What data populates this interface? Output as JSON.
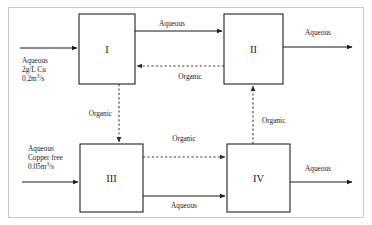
{
  "diagram": {
    "units": [
      {
        "id": "unit-1",
        "label": "I"
      },
      {
        "id": "unit-2",
        "label": "II"
      },
      {
        "id": "unit-3",
        "label": "III"
      },
      {
        "id": "unit-4",
        "label": "IV"
      }
    ],
    "feeds": {
      "left_top": {
        "line1": "Aqueous",
        "line2_prefix": "2g/L Cu",
        "line3_value": "0.2m",
        "line3_sup": "3",
        "line3_suffix": "/s"
      },
      "left_bottom": {
        "line1": "Aqueous",
        "line2": "Copper free",
        "line3_value": "0.05m",
        "line3_sup": "3",
        "line3_suffix": "/s"
      }
    },
    "streams": {
      "aqueous_1_to_2": "Aqueous",
      "aqueous_out_2": "Aqueous",
      "organic_2_to_1": "Organic",
      "organic_1_to_3": "Organic",
      "organic_3_to_4": "Organic",
      "organic_4_to_2": "Organic",
      "aqueous_3_to_4": "Aqueous",
      "aqueous_out_4": "Aqueous"
    },
    "colors": {
      "line": "#1a1a1a",
      "dashed": "#3a3a3a",
      "frame": "#c9c9c9",
      "background": "#ffffff"
    }
  }
}
